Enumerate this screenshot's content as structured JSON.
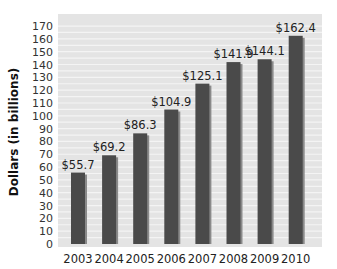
{
  "chart_data": {
    "type": "bar",
    "title": "",
    "xlabel": "",
    "ylabel": "Dollars (in billions)",
    "categories": [
      "2003",
      "2004",
      "2005",
      "2006",
      "2007",
      "2008",
      "2009",
      "2010"
    ],
    "values": [
      55.7,
      69.2,
      86.3,
      104.9,
      125.1,
      141.9,
      144.1,
      162.4
    ],
    "value_labels": [
      "$55.7",
      "$69.2",
      "$86.3",
      "$104.9",
      "$125.1",
      "$141.9",
      "$144.1",
      "$162.4"
    ],
    "ylim": [
      0,
      175
    ],
    "yticks": [
      0,
      10,
      20,
      30,
      40,
      50,
      60,
      70,
      80,
      90,
      100,
      110,
      120,
      130,
      140,
      150,
      160,
      170
    ],
    "grid": true,
    "legend": null
  },
  "colors": {
    "plot_bg": "#e4e4e4",
    "grid": "#f4f4f4",
    "bar": "#4a4a4a",
    "bar_shadow": "#8a8a8a"
  }
}
